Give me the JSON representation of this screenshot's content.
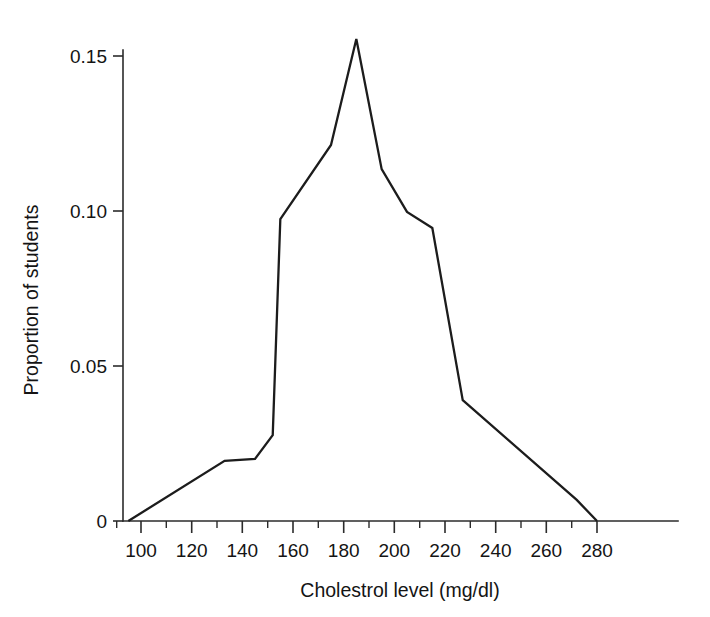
{
  "chart_data": {
    "type": "line",
    "title": "",
    "subtitle": "",
    "xlabel": "Cholestrol level (mg/dl)",
    "ylabel": "Proportion of students",
    "xlim": [
      88,
      300
    ],
    "ylim": [
      0,
      0.158
    ],
    "grid": false,
    "legend": null,
    "x_ticks_major": [
      100,
      120,
      140,
      160,
      180,
      200,
      220,
      240,
      260,
      280
    ],
    "x_tick_labels": [
      "100",
      "120",
      "140",
      "160",
      "180",
      "200",
      "220",
      "240",
      "260",
      "280"
    ],
    "x_ticks_minor": [
      90,
      110,
      130,
      150,
      170,
      190,
      210,
      230,
      250,
      270
    ],
    "y_ticks_major": [
      0,
      0.05,
      0.1,
      0.15
    ],
    "y_tick_labels": [
      "0",
      "0.05",
      "0.10",
      "0.15"
    ],
    "series": [
      {
        "name": "Proportion of students",
        "color": "#1c1c1c",
        "x": [
          95,
          133,
          145,
          152,
          155,
          175,
          185,
          195,
          205,
          215,
          227,
          272,
          280
        ],
        "y": [
          0.0,
          0.0194,
          0.02,
          0.0277,
          0.0974,
          0.1213,
          0.1555,
          0.1135,
          0.0997,
          0.0945,
          0.039,
          0.0068,
          0.0
        ]
      }
    ]
  },
  "axes": {
    "x_axis_name": "cholesterol-level-axis",
    "y_axis_name": "proportion-axis"
  },
  "colors": {
    "line": "#1c1c1c",
    "axis": "#2b2b2b",
    "text": "#141414",
    "background": "#ffffff"
  }
}
